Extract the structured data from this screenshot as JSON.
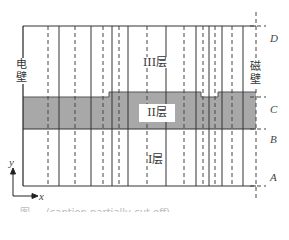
{
  "figure": {
    "labels": {
      "electric_wall": "电壁",
      "magnetic_wall": "磁壁",
      "layer_III": "III层",
      "layer_II": "II层",
      "layer_I": "I层"
    },
    "boundaries": [
      "D",
      "C",
      "B",
      "A"
    ],
    "axes": {
      "x": "x",
      "y": "y"
    },
    "colors": {
      "line": "#222222",
      "shaded_band": "#a8a8a8",
      "background": "#ffffff"
    },
    "caption": "图 ... (caption partially cut off)"
  }
}
